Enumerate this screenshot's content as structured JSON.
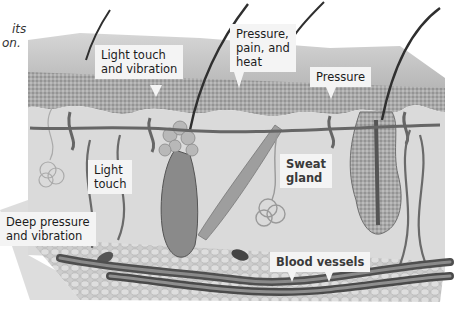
{
  "figure": {
    "caption_fragment": [
      "its",
      "on."
    ],
    "labels": [
      {
        "id": "light-touch-vibration",
        "lines": [
          "Light touch",
          "and vibration"
        ],
        "bold": false
      },
      {
        "id": "pressure-pain-heat",
        "lines": [
          "Pressure,",
          "pain, and",
          "heat"
        ],
        "bold": false
      },
      {
        "id": "pressure",
        "lines": [
          "Pressure"
        ],
        "bold": false
      },
      {
        "id": "light-touch",
        "lines": [
          "Light",
          "touch"
        ],
        "bold": false
      },
      {
        "id": "sweat-gland",
        "lines": [
          "Sweat",
          "gland"
        ],
        "bold": true
      },
      {
        "id": "deep-pressure-vibration",
        "lines": [
          "Deep pressure",
          "and vibration"
        ],
        "bold": false
      },
      {
        "id": "blood-vessels",
        "lines": [
          "Blood vessels"
        ],
        "bold": true
      }
    ],
    "colors": {
      "epidermis": "#b9b9b9",
      "dermis": "#d8d8d8",
      "fat": "#cfcfcf",
      "vessel": "#5c5c5c",
      "hair": "#333333",
      "label_bg": "#f4f4f4"
    }
  }
}
